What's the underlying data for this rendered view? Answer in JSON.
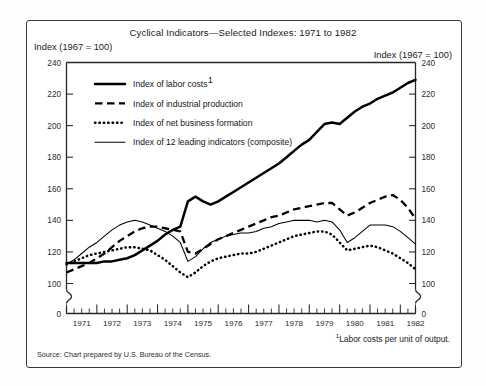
{
  "figure": {
    "title": "Cyclical Indicators—Selected Indexes: 1971 to 1982",
    "left_axis_caption": "Index (1967  =  100)",
    "right_axis_caption": "Index (1967  =  100)",
    "footnote": "Labor costs per unit of output.",
    "footnote_marker": "1",
    "source": "Source: Chart prepared by U.S. Bureau of the Census."
  },
  "legend": [
    {
      "label": "Index of labor costs",
      "marker": "1",
      "style": "solid-thick",
      "key": "labor_costs"
    },
    {
      "label": "Index of industrial production",
      "marker": "",
      "style": "dashed",
      "key": "industrial_production"
    },
    {
      "label": "Index of net business formation",
      "marker": "",
      "style": "dotted",
      "key": "net_business_formation"
    },
    {
      "label": "Index of 12 leading indicators (composite)",
      "marker": "",
      "style": "solid-thin",
      "key": "leading_indicators"
    }
  ],
  "chart_data": {
    "type": "line",
    "title": "Cyclical Indicators—Selected Indexes: 1971 to 1982",
    "xlabel": "",
    "ylabel": "Index (1967 = 100)",
    "ylim": [
      100,
      240
    ],
    "yticks": [
      100,
      120,
      140,
      160,
      180,
      200,
      220,
      240
    ],
    "y_axis_break_below": 100,
    "y_zero_tick": 0,
    "grid": false,
    "legend_position": "inside-upper-left",
    "x_tick_labels": [
      "1971",
      "1972",
      "1973",
      "1974",
      "1975",
      "1976",
      "1977",
      "1978",
      "1979",
      "1980",
      "1981",
      "1982"
    ],
    "x_minor_ticks_per_year": 4,
    "x": [
      1971.0,
      1971.25,
      1971.5,
      1971.75,
      1972.0,
      1972.25,
      1972.5,
      1972.75,
      1973.0,
      1973.25,
      1973.5,
      1973.75,
      1974.0,
      1974.25,
      1974.5,
      1974.75,
      1975.0,
      1975.25,
      1975.5,
      1975.75,
      1976.0,
      1976.25,
      1976.5,
      1976.75,
      1977.0,
      1977.25,
      1977.5,
      1977.75,
      1978.0,
      1978.25,
      1978.5,
      1978.75,
      1979.0,
      1979.25,
      1979.5,
      1979.75,
      1980.0,
      1980.25,
      1980.5,
      1980.75,
      1981.0,
      1981.25,
      1981.5,
      1981.75,
      1982.0,
      1982.25,
      1982.5
    ],
    "series": [
      {
        "name": "Index of labor costs",
        "style": "solid-thick",
        "values": [
          113,
          113,
          113,
          113,
          113,
          114,
          114,
          115,
          116,
          118,
          121,
          124,
          127,
          131,
          134,
          136,
          152,
          155,
          152,
          150,
          152,
          155,
          158,
          161,
          164,
          167,
          170,
          173,
          176,
          180,
          184,
          188,
          191,
          196,
          201,
          202,
          201,
          205,
          209,
          212,
          214,
          217,
          219,
          221,
          224,
          227,
          229
        ]
      },
      {
        "name": "Index of industrial production",
        "style": "dashed",
        "values": [
          107,
          109,
          111,
          113,
          116,
          119,
          123,
          127,
          130,
          133,
          135,
          136,
          136,
          135,
          134,
          133,
          120,
          119,
          122,
          125,
          128,
          130,
          132,
          134,
          136,
          138,
          140,
          142,
          143,
          145,
          147,
          148,
          149,
          150,
          151,
          151,
          147,
          143,
          145,
          148,
          151,
          153,
          155,
          156,
          153,
          148,
          141
        ]
      },
      {
        "name": "Index of net business formation",
        "style": "dotted",
        "values": [
          112,
          114,
          116,
          118,
          119,
          120,
          121,
          122,
          123,
          123,
          122,
          121,
          118,
          115,
          111,
          107,
          104,
          107,
          111,
          114,
          116,
          117,
          118,
          119,
          119,
          120,
          122,
          124,
          126,
          128,
          130,
          131,
          132,
          133,
          133,
          131,
          126,
          121,
          122,
          123,
          124,
          123,
          121,
          119,
          116,
          113,
          109
        ]
      },
      {
        "name": "Index of 12 leading indicators (composite)",
        "style": "solid-thin",
        "values": [
          112,
          115,
          119,
          123,
          126,
          130,
          134,
          137,
          139,
          140,
          139,
          137,
          135,
          133,
          130,
          126,
          114,
          117,
          122,
          126,
          128,
          130,
          131,
          132,
          132,
          133,
          135,
          136,
          138,
          139,
          140,
          140,
          140,
          139,
          140,
          139,
          134,
          126,
          129,
          133,
          137,
          137,
          137,
          136,
          133,
          129,
          125
        ]
      }
    ]
  }
}
